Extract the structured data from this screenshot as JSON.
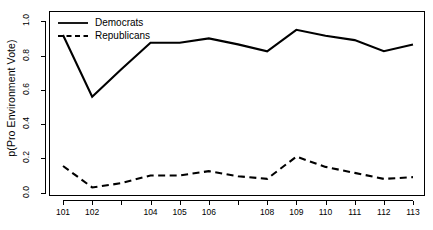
{
  "chart_data": {
    "type": "line",
    "title": "",
    "xlabel": "",
    "ylabel": "p(Pro Environment Vote)",
    "x": [
      101,
      102,
      103,
      104,
      105,
      106,
      107,
      108,
      109,
      110,
      111,
      112,
      113
    ],
    "categories": [
      "101",
      "102",
      "103",
      "104",
      "105",
      "106",
      "107",
      "108",
      "109",
      "110",
      "111",
      "112",
      "113"
    ],
    "xtick_labels": [
      "101",
      "102",
      "",
      "104",
      "105",
      "106",
      "",
      "108",
      "109",
      "110",
      "111",
      "112",
      "113"
    ],
    "ytick_labels": [
      "0.0",
      "0.2",
      "0.4",
      "0.6",
      "0.8",
      "1.0"
    ],
    "ytick_values": [
      0.0,
      0.2,
      0.4,
      0.6,
      0.8,
      1.0
    ],
    "xlim": [
      101,
      113
    ],
    "ylim": [
      -0.02,
      1.06
    ],
    "grid": false,
    "legend_position": "top-left",
    "series": [
      {
        "name": "Democrats",
        "style": "solid",
        "color": "#000000",
        "values": [
          0.92,
          0.56,
          0.72,
          0.875,
          0.875,
          0.9,
          0.865,
          0.825,
          0.95,
          0.915,
          0.89,
          0.825,
          0.865
        ]
      },
      {
        "name": "Republicans",
        "style": "dashed",
        "color": "#000000",
        "values": [
          0.155,
          0.03,
          0.055,
          0.1,
          0.1,
          0.125,
          0.095,
          0.08,
          0.21,
          0.15,
          0.115,
          0.08,
          0.09
        ]
      }
    ]
  },
  "legend": {
    "items": [
      {
        "label": "Democrats",
        "key": "solid-line-key"
      },
      {
        "label": "Republicans",
        "key": "dashed-line-key"
      }
    ]
  },
  "axes": {
    "y_title": "p(Pro Environment Vote)"
  }
}
